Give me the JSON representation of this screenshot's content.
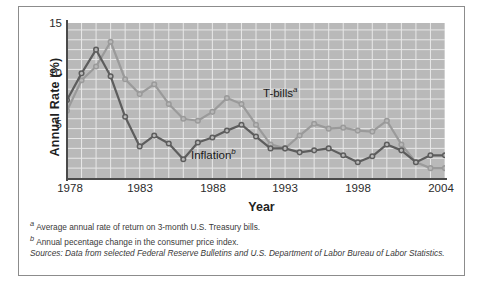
{
  "figure": {
    "ylabel": "Annual Rate (%)",
    "xlabel": "Year"
  },
  "axis": {
    "yticks": [
      "15",
      "10",
      "5"
    ],
    "xticks": [
      "1978",
      "1983",
      "1988",
      "1993",
      "1998",
      "2004"
    ]
  },
  "labels": {
    "tbills": "T-bills",
    "tbills_marker": "a",
    "inflation": "Inflation",
    "inflation_marker": "b"
  },
  "notes": {
    "a_marker": "a",
    "a_text": "Average annual rate of return on 3-month U.S. Treasury bills.",
    "b_marker": "b",
    "b_text": "Annual pecentage change in the consumer price index.",
    "source": "Sources: Data from selected Federal Reserve Bulletins and U.S. Department of Labor Bureau of Labor Statistics."
  },
  "colors": {
    "plot_background": "#b9b9b9",
    "gridline": "#e8e8e8",
    "tbills_line": "#9a9a9a",
    "inflation_line": "#5d5d5d",
    "axis": "#4a4a4a",
    "frame": "#8c8c8c",
    "text": "#2b2b2b"
  },
  "chart_data": {
    "type": "line",
    "title": "",
    "xlabel": "Year",
    "ylabel": "Annual Rate (%)",
    "xlim": [
      1978,
      2004
    ],
    "ylim": [
      0,
      15.7
    ],
    "yticks": [
      5,
      10,
      15
    ],
    "xticks": [
      1978,
      1983,
      1988,
      1993,
      1998,
      2004
    ],
    "grid": true,
    "grid_x_step": 1,
    "grid_y_step": 1,
    "legend": "inline-annotations",
    "x": [
      1978,
      1979,
      1980,
      1981,
      1982,
      1983,
      1984,
      1985,
      1986,
      1987,
      1988,
      1989,
      1990,
      1991,
      1992,
      1993,
      1994,
      1995,
      1996,
      1997,
      1998,
      1999,
      2000,
      2001,
      2002,
      2003,
      2004
    ],
    "series": [
      {
        "name": "T-bills",
        "color": "#9a9a9a",
        "marker": "o",
        "values": [
          6.8,
          9.9,
          11.3,
          13.8,
          10.0,
          8.5,
          9.5,
          7.5,
          6.0,
          5.8,
          6.7,
          8.1,
          7.5,
          5.4,
          3.4,
          3.0,
          4.3,
          5.5,
          5.0,
          5.1,
          4.8,
          4.7,
          5.8,
          3.4,
          1.6,
          1.0,
          1.0
        ]
      },
      {
        "name": "Inflation",
        "color": "#5d5d5d",
        "marker": "o",
        "values": [
          7.9,
          10.6,
          13.0,
          10.3,
          6.2,
          3.2,
          4.3,
          3.5,
          1.9,
          3.6,
          4.1,
          4.8,
          5.4,
          4.2,
          3.0,
          3.0,
          2.6,
          2.8,
          3.0,
          2.3,
          1.6,
          2.2,
          3.4,
          2.8,
          1.6,
          2.3,
          2.3
        ]
      }
    ]
  }
}
